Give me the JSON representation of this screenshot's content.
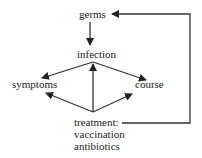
{
  "diagram": {
    "nodes": {
      "germs": "germs",
      "infection": "infection",
      "symptoms": "symptoms",
      "course": "course",
      "treatment": "treatment:",
      "treatment_items": [
        "vaccination",
        "antibiotics"
      ]
    },
    "edges": [
      {
        "from": "germs",
        "to": "infection"
      },
      {
        "from": "infection",
        "to": "symptoms"
      },
      {
        "from": "infection",
        "to": "course"
      },
      {
        "from": "treatment",
        "to": "infection"
      },
      {
        "from": "treatment",
        "to": "symptoms"
      },
      {
        "from": "treatment",
        "to": "course"
      },
      {
        "from": "treatment",
        "to": "germs"
      }
    ],
    "colors": {
      "line": "#333333",
      "text": "#222222",
      "background": "#ffffff"
    }
  }
}
